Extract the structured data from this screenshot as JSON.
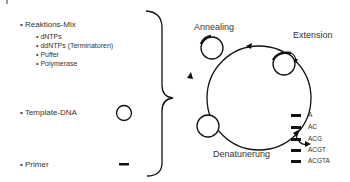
{
  "components": {
    "reaction_mix": {
      "label": "• Reaktions-Mix",
      "items": [
        "• dNTPs",
        "• ddNTPs (Terminatoren)",
        "• Puffer",
        "• Polymerase"
      ]
    },
    "template": {
      "label": "• Template-DNA"
    },
    "primer": {
      "label": "• Primer"
    }
  },
  "cycle": {
    "steps": [
      "Annealing",
      "Extension",
      "Denaturierung"
    ]
  },
  "fragments": [
    "A",
    "AC",
    "ACG",
    "ACGT",
    "ACGTA"
  ]
}
